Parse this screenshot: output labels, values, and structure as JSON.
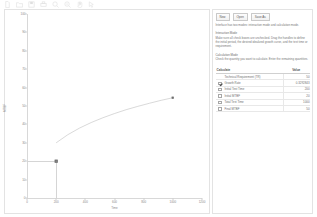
{
  "toolbar": {
    "icons": [
      {
        "name": "new-file-icon"
      },
      {
        "name": "open-folder-icon"
      },
      {
        "name": "save-disk-icon"
      },
      {
        "name": "print-icon"
      },
      {
        "name": "zoom-in-icon"
      },
      {
        "name": "zoom-out-icon"
      },
      {
        "name": "pan-hand-icon"
      },
      {
        "name": "cursor-arrow-icon"
      }
    ]
  },
  "chart_data": {
    "type": "line",
    "title": "",
    "xlabel": "Time",
    "ylabel": "MTBF",
    "xlim": [
      0,
      1200
    ],
    "ylim": [
      0,
      100
    ],
    "xticks": [
      0,
      200,
      400,
      600,
      800,
      1000,
      1200
    ],
    "yticks": [
      0,
      10,
      20,
      30,
      40,
      50,
      60,
      70,
      80,
      90,
      100
    ],
    "grid": false,
    "legend": null,
    "series": [
      {
        "name": "Idealized Growth Curve",
        "x": [
          200,
          280,
          360,
          440,
          520,
          600,
          680,
          760,
          840,
          920,
          1000
        ],
        "y": [
          30.0,
          34.4,
          38.0,
          41.0,
          43.6,
          45.9,
          48.0,
          49.8,
          51.5,
          53.1,
          54.5
        ]
      }
    ],
    "handles": [
      {
        "name": "initial-mtbf-handle",
        "x": 200,
        "y": 20
      },
      {
        "name": "final-mtbf-handle",
        "x": 1000,
        "y": 54.5
      }
    ],
    "guides": [
      {
        "name": "initial-mtbf-guide",
        "from_x": 0,
        "to_x": 200,
        "y": 20
      },
      {
        "name": "initial-time-guide",
        "x": 200,
        "from_y": 0,
        "to_y": 20
      }
    ]
  },
  "panel": {
    "buttons": [
      {
        "name": "new-button",
        "label": "New"
      },
      {
        "name": "open-button",
        "label": "Open"
      },
      {
        "name": "save-as-button",
        "label": "Save As"
      }
    ],
    "intro_text": "Interface has two modes: interaction mode and calculation mode.",
    "interaction_heading": "Interaction Mode",
    "interaction_text": "Make sure all check boxes are unchecked. Drag the handles to define the initial period, the desired idealized growth curve, and the test time or requirement.",
    "calculation_heading": "Calculation Mode",
    "calculation_text": "Check the quantity you want to calculate. Enter the remaining quantities.",
    "table": {
      "headers": {
        "calculate": "Calculate",
        "value": "Value"
      },
      "rows": [
        {
          "name": "technical-requirement",
          "has_checkbox": false,
          "checked": false,
          "label": "Technical Requirement (TR)",
          "value": "50"
        },
        {
          "name": "growth-rate",
          "has_checkbox": true,
          "checked": true,
          "label": "Growth Rate",
          "value": "0.3292843"
        },
        {
          "name": "initial-test-time",
          "has_checkbox": true,
          "checked": false,
          "label": "Initial Test Time",
          "value": "200"
        },
        {
          "name": "initial-mtbf",
          "has_checkbox": true,
          "checked": false,
          "label": "Initial MTBF",
          "value": "20"
        },
        {
          "name": "total-test-time",
          "has_checkbox": true,
          "checked": false,
          "label": "Total Test Time",
          "value": "1000"
        },
        {
          "name": "final-mtbf",
          "has_checkbox": true,
          "checked": false,
          "label": "Final MTBF",
          "value": "50"
        }
      ]
    }
  }
}
